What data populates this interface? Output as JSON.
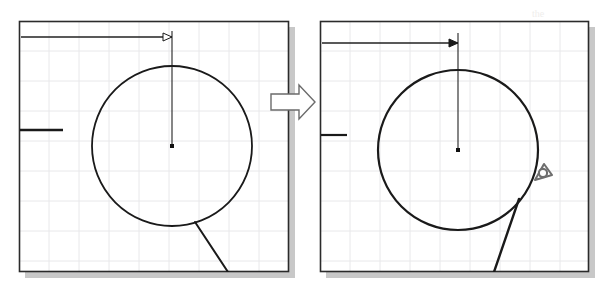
{
  "figure": {
    "background_color": "#ffffff",
    "width": 606,
    "height": 291,
    "transition_icon": "block-arrow-right-icon",
    "transition_label": ""
  },
  "panels": [
    {
      "id": "before",
      "name": "panel-before",
      "frame": {
        "x": 19,
        "y": 21,
        "width": 270,
        "height": 251
      },
      "border_color": "#2b2b2b",
      "shadow_color": "#9a9a9a",
      "grid": {
        "visible": true,
        "spacing": 30,
        "color": "#e8e8ea",
        "line_width": 1
      },
      "circle": {
        "name": "circle-entity",
        "center_x": 172,
        "center_y": 146,
        "radius": 80,
        "stroke": "#1a1a1a",
        "stroke_width": 1.8
      },
      "center_marker": {
        "name": "circle-center-point",
        "x": 172,
        "y": 146,
        "size": 4,
        "fill": "#111111"
      },
      "radius_leader": {
        "name": "vertical-leader-line",
        "x1": 172,
        "y1": 146,
        "x2": 172,
        "y2": 31,
        "stroke": "#222222",
        "stroke_width": 1.1
      },
      "dimension_line": {
        "name": "horizontal-dimension-line",
        "x1": 21,
        "y1": 37,
        "x2": 172,
        "y2": 37,
        "stroke": "#222222",
        "stroke_width": 1.6,
        "arrowhead": "hollow",
        "arrowhead_name": "arrowhead-hollow-icon"
      },
      "extension_tick": {
        "name": "left-extension-tick",
        "x1": 20,
        "y1": 130,
        "x2": 63,
        "y2": 130,
        "stroke": "#1a1a1a",
        "stroke_width": 2.4
      },
      "tangent_line": {
        "name": "tangent-line",
        "x1": 195,
        "y1": 222,
        "x2": 228,
        "y2": 272,
        "stroke": "#1a1a1a",
        "stroke_width": 2.0
      },
      "cursor": {
        "visible": false,
        "name": "snap-cursor-icon"
      }
    },
    {
      "id": "after",
      "name": "panel-after",
      "frame": {
        "x": 320,
        "y": 21,
        "width": 269,
        "height": 251
      },
      "border_color": "#2b2b2b",
      "shadow_color": "#9a9a9a",
      "grid": {
        "visible": true,
        "spacing": 30,
        "color": "#e8e8ea",
        "line_width": 1
      },
      "circle": {
        "name": "circle-entity",
        "center_x": 458,
        "center_y": 150,
        "radius": 80,
        "stroke": "#1a1a1a",
        "stroke_width": 2.2
      },
      "center_marker": {
        "name": "circle-center-point",
        "x": 458,
        "y": 150,
        "size": 4,
        "fill": "#111111"
      },
      "radius_leader": {
        "name": "vertical-leader-line",
        "x1": 458,
        "y1": 150,
        "x2": 458,
        "y2": 33,
        "stroke": "#222222",
        "stroke_width": 1.1
      },
      "dimension_line": {
        "name": "horizontal-dimension-line",
        "x1": 322,
        "y1": 43,
        "x2": 458,
        "y2": 43,
        "stroke": "#222222",
        "stroke_width": 1.6,
        "arrowhead": "filled",
        "arrowhead_name": "arrowhead-filled-icon"
      },
      "extension_tick": {
        "name": "left-extension-tick",
        "x1": 321,
        "y1": 135,
        "x2": 347,
        "y2": 135,
        "stroke": "#1a1a1a",
        "stroke_width": 2.2
      },
      "tangent_line": {
        "name": "tangent-line",
        "x1": 519,
        "y1": 199,
        "x2": 494,
        "y2": 272,
        "stroke": "#1a1a1a",
        "stroke_width": 2.4
      },
      "cursor": {
        "visible": true,
        "name": "snap-cursor-icon",
        "x": 543,
        "y": 173,
        "snap_type": "tangent",
        "stroke": "#6e6e6e"
      }
    }
  ],
  "ghost_text": [
    {
      "text": "Figure 2.14",
      "x": 398,
      "y": 38,
      "size": 11,
      "italic": true
    },
    {
      "text": "Using the Tangent snap",
      "x": 378,
      "y": 118,
      "size": 11,
      "italic": false
    },
    {
      "text": "to draw a line",
      "x": 452,
      "y": 174,
      "size": 11,
      "italic": false
    },
    {
      "text": "the",
      "x": 532,
      "y": 8,
      "size": 10,
      "italic": false
    }
  ]
}
